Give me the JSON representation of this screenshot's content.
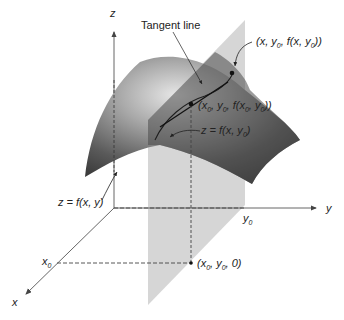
{
  "diagram": {
    "axes": {
      "x_label": "x",
      "y_label": "y",
      "z_label": "z",
      "x0_label": "x",
      "x0_sub": "0",
      "y0_label": "y",
      "y0_sub": "0"
    },
    "labels": {
      "tangent_line": "Tangent line",
      "surface": "z = f(x, y)",
      "curve": "z = f(x, y",
      "curve_sub": "0",
      "point_general": "(x, y",
      "point_general_sub": "0",
      "point_general_tail": ", f(x, y",
      "point_general_sub2": "0",
      "point_general_end": "))",
      "point_tangent": "(x",
      "point_tangent_sub1": "0",
      "point_tangent_mid1": ", y",
      "point_tangent_sub2": "0",
      "point_tangent_mid2": ", f(x",
      "point_tangent_sub3": "0",
      "point_tangent_mid3": ", y",
      "point_tangent_sub4": "0",
      "point_tangent_end": "))",
      "point_base": "(x",
      "point_base_sub1": "0",
      "point_base_mid": ", y",
      "point_base_sub2": "0",
      "point_base_end": ", 0)"
    },
    "colors": {
      "surface_dark": "#3a3a3a",
      "surface_light": "#d8d8d8",
      "plane": "#c8c8c8",
      "axis": "#444444",
      "text": "#222222"
    }
  }
}
